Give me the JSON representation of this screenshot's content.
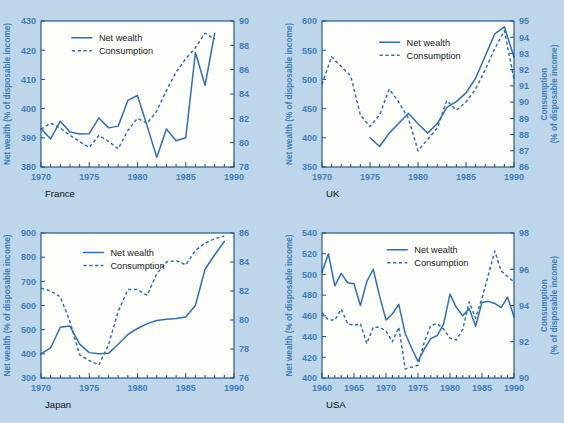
{
  "page": {
    "background_color": "#bdd6e9",
    "plot_background_color": "#fdfdfa",
    "line_color": "#2f6fb5",
    "axis_color": "#1b4f86",
    "axis_text_color": "#3f7fba"
  },
  "legend": {
    "net_wealth": "Net wealth",
    "consumption": "Consumption"
  },
  "labels": {
    "left_axis_title": "Net wealth (% of disposable income)",
    "right_axis_title_line1": "Consumption",
    "right_axis_title_line2": "(% of disposable income)"
  },
  "chart_data": [
    {
      "type": "line",
      "title": "France",
      "xlabel": "",
      "ylabel": "Net wealth (% of disposable income)",
      "y2label": "Consumption (% of disposable income)",
      "xlim": [
        1970,
        1990
      ],
      "ylim": [
        380,
        430
      ],
      "y2lim": [
        78,
        90
      ],
      "xticks": [
        1970,
        1975,
        1980,
        1985,
        1990
      ],
      "yticks": [
        380,
        390,
        400,
        410,
        420,
        430
      ],
      "y2ticks": [
        78,
        80,
        82,
        84,
        86,
        88,
        90
      ],
      "grid": false,
      "legend_position": "top-left",
      "x": [
        1970,
        1971,
        1972,
        1973,
        1974,
        1975,
        1976,
        1977,
        1978,
        1979,
        1980,
        1981,
        1982,
        1983,
        1984,
        1985,
        1986,
        1987,
        1988
      ],
      "series": [
        {
          "name": "Net wealth",
          "axis": "left",
          "style": "solid",
          "values": [
            393.2,
            389.6,
            395.7,
            392.0,
            391.3,
            391.4,
            396.8,
            393.4,
            394.0,
            402.8,
            404.5,
            394.0,
            383.3,
            393.0,
            389.0,
            390.0,
            419.2,
            408.0,
            425.8
          ]
        },
        {
          "name": "Consumption",
          "axis": "right",
          "style": "dashed",
          "values": [
            81.1,
            81.6,
            81.2,
            80.6,
            80.1,
            79.6,
            80.6,
            80.1,
            79.5,
            81.0,
            82.0,
            81.6,
            82.6,
            84.3,
            85.8,
            86.9,
            87.8,
            89.0,
            88.5
          ]
        }
      ]
    },
    {
      "type": "line",
      "title": "UK",
      "xlabel": "",
      "ylabel": "Net wealth (% of disposable income)",
      "y2label": "Consumption (% of disposable income)",
      "xlim": [
        1970,
        1990
      ],
      "ylim": [
        350,
        600
      ],
      "y2lim": [
        86,
        95
      ],
      "xticks": [
        1970,
        1975,
        1980,
        1985,
        1990
      ],
      "yticks": [
        350,
        400,
        450,
        500,
        550,
        600
      ],
      "y2ticks": [
        86,
        87,
        88,
        89,
        90,
        91,
        92,
        93,
        94,
        95
      ],
      "grid": false,
      "legend_position": "top-center",
      "x": [
        1975,
        1976,
        1977,
        1978,
        1979,
        1980,
        1981,
        1982,
        1983,
        1984,
        1985,
        1986,
        1987,
        1988,
        1989,
        1990
      ],
      "series": [
        {
          "name": "Net wealth",
          "axis": "left",
          "style": "solid",
          "values": [
            400,
            385,
            408,
            425,
            442,
            424,
            408,
            424,
            452,
            462,
            477,
            502,
            540,
            578,
            590,
            538
          ]
        },
        {
          "name": "Consumption",
          "axis": "right",
          "style": "dashed",
          "x": [
            1970,
            1971,
            1972,
            1973,
            1974,
            1975,
            1976,
            1977,
            1978,
            1979,
            1980,
            1981,
            1982,
            1983,
            1984,
            1985,
            1986,
            1987,
            1988,
            1989,
            1990
          ],
          "values": [
            91.1,
            92.8,
            92.2,
            91.6,
            89.2,
            88.5,
            89.2,
            90.8,
            90.0,
            89.0,
            87.0,
            87.7,
            88.4,
            90.1,
            89.5,
            90.0,
            90.8,
            92.0,
            93.3,
            94.4,
            91.4
          ]
        }
      ]
    },
    {
      "type": "line",
      "title": "Japan",
      "xlabel": "",
      "ylabel": "Net wealth (% of disposable income)",
      "y2label": "Consumption (% of disposable income)",
      "xlim": [
        1970,
        1990
      ],
      "ylim": [
        300,
        900
      ],
      "y2lim": [
        76,
        86
      ],
      "xticks": [
        1970,
        1975,
        1980,
        1985,
        1990
      ],
      "yticks": [
        300,
        400,
        500,
        600,
        700,
        800,
        900
      ],
      "y2ticks": [
        76,
        78,
        80,
        82,
        84,
        86
      ],
      "grid": false,
      "legend_position": "top-center",
      "x": [
        1970,
        1971,
        1972,
        1973,
        1974,
        1975,
        1976,
        1977,
        1978,
        1979,
        1980,
        1981,
        1982,
        1983,
        1984,
        1985,
        1986,
        1987,
        1988,
        1989
      ],
      "series": [
        {
          "name": "Net wealth",
          "axis": "left",
          "style": "solid",
          "values": [
            400,
            425,
            510,
            515,
            440,
            405,
            400,
            402,
            440,
            480,
            505,
            525,
            538,
            543,
            546,
            552,
            600,
            750,
            810,
            865
          ]
        },
        {
          "name": "Consumption",
          "axis": "right",
          "style": "dashed",
          "values": [
            82.2,
            82.0,
            81.6,
            79.9,
            77.6,
            77.2,
            76.9,
            78.3,
            80.6,
            82.1,
            82.1,
            81.7,
            83.2,
            84.0,
            84.1,
            83.8,
            84.8,
            85.3,
            85.6,
            85.8
          ]
        }
      ]
    },
    {
      "type": "line",
      "title": "USA",
      "xlabel": "",
      "ylabel": "Net wealth (% of disposable income)",
      "y2label": "Consumption (% of disposable income)",
      "xlim": [
        1960,
        1990
      ],
      "ylim": [
        400,
        540
      ],
      "y2lim": [
        90,
        98
      ],
      "xticks": [
        1960,
        1965,
        1970,
        1975,
        1980,
        1985,
        1990
      ],
      "yticks": [
        400,
        420,
        440,
        460,
        480,
        500,
        520,
        540
      ],
      "y2ticks": [
        90,
        92,
        94,
        96,
        98
      ],
      "grid": false,
      "legend_position": "top-center",
      "x": [
        1960,
        1961,
        1962,
        1963,
        1964,
        1965,
        1966,
        1967,
        1968,
        1969,
        1970,
        1971,
        1972,
        1973,
        1974,
        1975,
        1976,
        1977,
        1978,
        1979,
        1980,
        1981,
        1982,
        1983,
        1984,
        1985,
        1986,
        1987,
        1988,
        1989,
        1990
      ],
      "series": [
        {
          "name": "Net wealth",
          "axis": "left",
          "style": "solid",
          "values": [
            502,
            520,
            489,
            501,
            492,
            491,
            470,
            493,
            505,
            479,
            456,
            462,
            471,
            443,
            429,
            416,
            428,
            438,
            441,
            452,
            481,
            468,
            460,
            467,
            450,
            473,
            474,
            472,
            468,
            478,
            459
          ]
        },
        {
          "name": "Consumption",
          "axis": "right",
          "style": "dashed",
          "values": [
            93.6,
            93.2,
            93.2,
            93.8,
            93.0,
            92.9,
            93.0,
            91.9,
            92.8,
            92.8,
            92.6,
            92.0,
            92.8,
            90.5,
            90.6,
            90.7,
            92.0,
            92.9,
            93.0,
            92.7,
            92.2,
            92.1,
            92.7,
            94.2,
            93.3,
            94.4,
            95.7,
            97.0,
            95.9,
            95.6,
            95.3
          ]
        }
      ]
    }
  ]
}
